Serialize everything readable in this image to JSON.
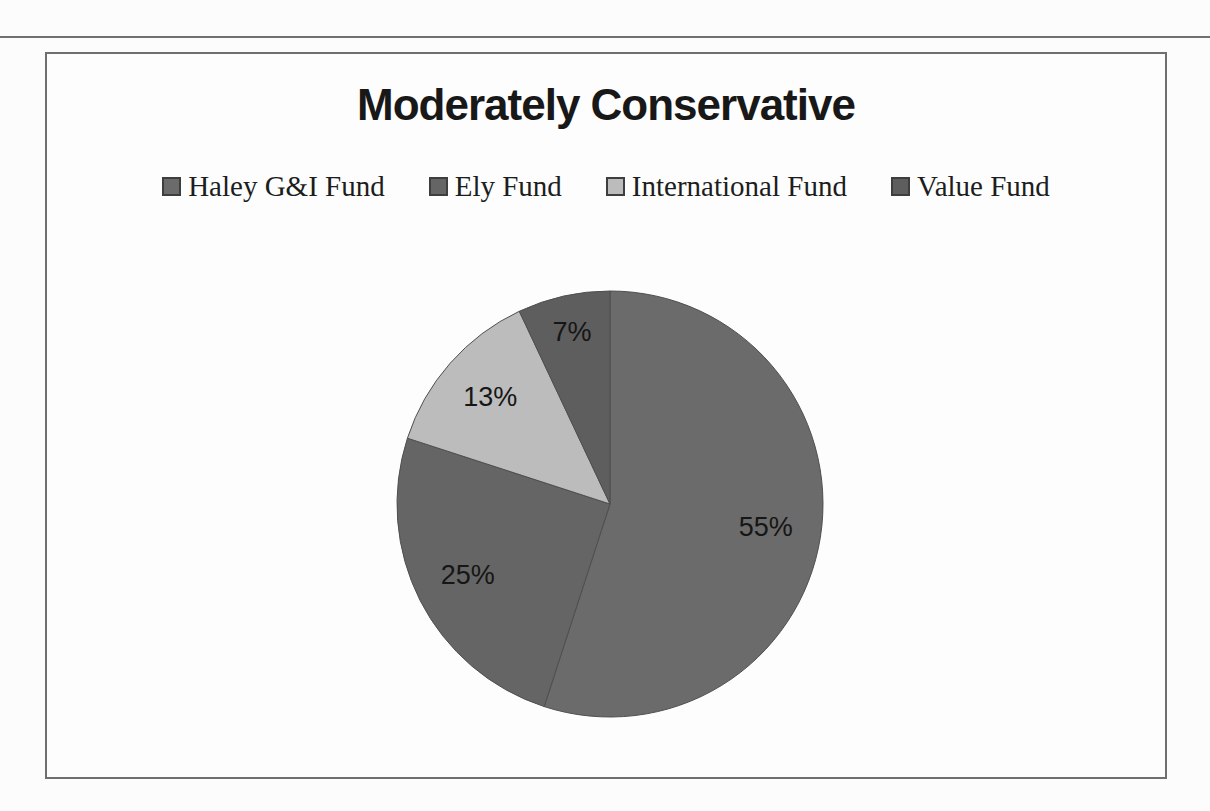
{
  "page": {
    "rule_color": "#707070",
    "frame_border_color": "#6f6f6f",
    "background": "#fdfdfd"
  },
  "chart_data": {
    "type": "pie",
    "title": "Moderately Conservative",
    "categories": [
      "Haley G&I Fund",
      "Ely Fund",
      "International Fund",
      "Value Fund"
    ],
    "values": [
      55,
      25,
      13,
      7
    ],
    "data_labels": [
      "55%",
      "25%",
      "13%",
      "7%"
    ],
    "slice_colors": [
      "#6b6b6b",
      "#656565",
      "#bcbcbc",
      "#5e5e5e"
    ],
    "slice_stroke_color": "#4f4f4f",
    "label_color": "#161616",
    "legend_position": "top",
    "legend_swatch_border": "#3e3e3e",
    "start_angle_deg": 0,
    "direction": "clockwise",
    "label_radius_fractions": [
      0.74,
      0.75,
      0.75,
      0.82
    ]
  }
}
